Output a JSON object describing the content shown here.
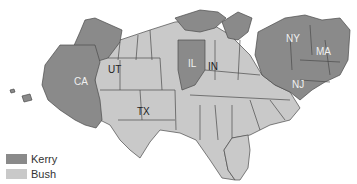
{
  "map": {
    "type": "cartogram",
    "subject": "2004 US presidential election results by state",
    "colors": {
      "kerry": "#8a8a8a",
      "bush": "#c9c9c9",
      "border": "#4a4a4a",
      "background": "#ffffff"
    },
    "labels": [
      {
        "id": "CA",
        "text": "CA",
        "winner": "kerry"
      },
      {
        "id": "UT",
        "text": "UT",
        "winner": "bush"
      },
      {
        "id": "IL",
        "text": "IL",
        "winner": "kerry"
      },
      {
        "id": "IN",
        "text": "IN",
        "winner": "bush"
      },
      {
        "id": "TX",
        "text": "TX",
        "winner": "bush"
      },
      {
        "id": "NY",
        "text": "NY",
        "winner": "kerry"
      },
      {
        "id": "MA",
        "text": "MA",
        "winner": "kerry"
      },
      {
        "id": "NJ",
        "text": "NJ",
        "winner": "kerry"
      }
    ]
  },
  "legend": {
    "items": [
      {
        "label": "Kerry",
        "color": "#8a8a8a"
      },
      {
        "label": "Bush",
        "color": "#c9c9c9"
      }
    ]
  }
}
